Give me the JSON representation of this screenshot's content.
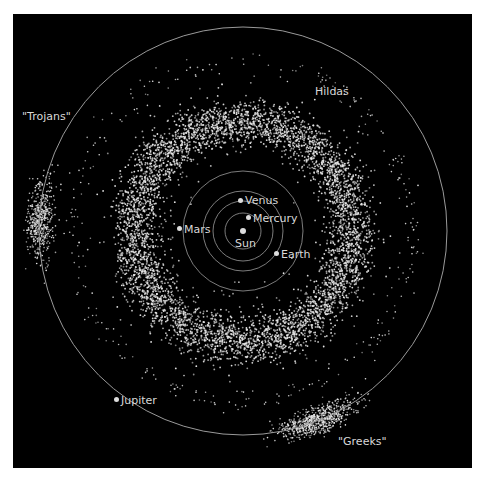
{
  "diagram": {
    "colors": {
      "background": "#000000",
      "asteroids": "#e8e8e8",
      "orbits": "#9a9a9a",
      "labels": "#d8d8d8"
    },
    "bodies": [
      {
        "id": "sun",
        "label": "Sun"
      },
      {
        "id": "mercury",
        "label": "Mercury"
      },
      {
        "id": "venus",
        "label": "Venus"
      },
      {
        "id": "earth",
        "label": "Earth"
      },
      {
        "id": "mars",
        "label": "Mars"
      },
      {
        "id": "jupiter",
        "label": "Jupiter"
      }
    ],
    "groups": [
      {
        "id": "trojans",
        "label": "\"Trojans\""
      },
      {
        "id": "greeks",
        "label": "\"Greeks\""
      },
      {
        "id": "hildas",
        "label": "Hildas"
      }
    ]
  }
}
